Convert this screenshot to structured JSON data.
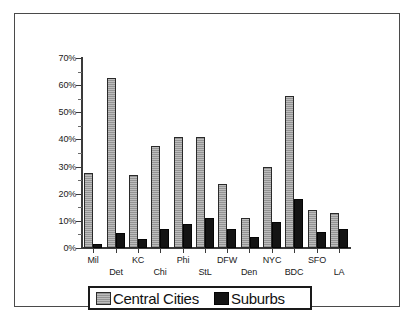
{
  "chart_data": {
    "type": "bar",
    "title": "",
    "xlabel": "",
    "ylabel": "",
    "ylim": [
      0,
      70
    ],
    "ytick_labels": [
      "70%",
      "60%",
      "50%",
      "40%",
      "30%",
      "20%",
      "10%",
      "0%"
    ],
    "ytick_values": [
      70,
      60,
      50,
      40,
      30,
      20,
      10,
      0
    ],
    "grid": false,
    "legend_position": "bottom",
    "categories": [
      "Mil",
      "Det",
      "KC",
      "Chi",
      "Phi",
      "StL",
      "DFW",
      "Den",
      "NYC",
      "BDC",
      "SFO",
      "LA"
    ],
    "series": [
      {
        "name": "Central Cities",
        "color": "#bdbdbd",
        "values": [
          27.5,
          62.5,
          27,
          37.5,
          41,
          41,
          23.5,
          11,
          30,
          56,
          14,
          13
        ]
      },
      {
        "name": "Suburbs",
        "color": "#141414",
        "values": [
          1.5,
          5.5,
          3.5,
          7,
          9,
          11,
          7,
          4,
          9.5,
          18,
          6,
          7
        ]
      }
    ]
  },
  "legend": {
    "items": [
      {
        "label": "Central Cities",
        "swatch": "central-cities-swatch"
      },
      {
        "label": "Suburbs",
        "swatch": "suburbs-swatch"
      }
    ]
  }
}
